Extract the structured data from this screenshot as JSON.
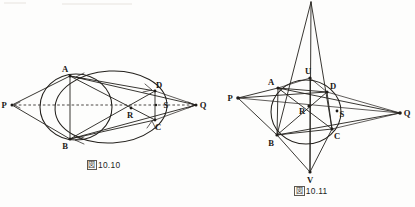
{
  "page": {
    "width": 415,
    "height": 207,
    "background": "#fdfdfc",
    "ink_color": "#23201c"
  },
  "figures": [
    {
      "id": "figure-10-10",
      "caption_marker": "図",
      "caption_number": "10.10",
      "caption_full": "図10.10",
      "description": "Ellipse and circle through points A, B with inscribed quadrilateral ABCD, diagonal intersection R, point S, and external points P and Q joined by a dashed line P-R-S-Q.",
      "points": [
        {
          "label": "A",
          "x": 70,
          "y": 76,
          "label_dx": -5,
          "label_dy": -4
        },
        {
          "label": "B",
          "x": 70,
          "y": 139,
          "label_dx": -5,
          "label_dy": 10
        },
        {
          "label": "C",
          "x": 155,
          "y": 120,
          "label_dx": 2,
          "label_dy": 10
        },
        {
          "label": "D",
          "x": 155,
          "y": 91,
          "label_dx": 3,
          "label_dy": -3
        },
        {
          "label": "R",
          "x": 131,
          "y": 108,
          "label_dx": -2,
          "label_dy": 10
        },
        {
          "label": "S",
          "x": 160,
          "y": 105,
          "label_dx": 4,
          "label_dy": 2
        },
        {
          "label": "P",
          "x": 12,
          "y": 105,
          "label_dx": -9,
          "label_dy": 3
        },
        {
          "label": "Q",
          "x": 196,
          "y": 105,
          "label_dx": 4,
          "label_dy": 3
        }
      ],
      "segments": [
        "P-A",
        "P-B",
        "A-B",
        "A-C",
        "A-D",
        "B-C",
        "B-D",
        "C-D",
        "A-Q",
        "B-Q",
        "D-Q",
        "C-Q"
      ],
      "dashed_segments": [
        "P-Q through R and S"
      ],
      "curves": [
        "ellipse through A B C D",
        "circle through A B"
      ]
    },
    {
      "id": "figure-10-11",
      "caption_marker": "図",
      "caption_number": "10.11",
      "caption_full": "図10.11",
      "description": "Circle through A, B, C, D with apex above, interior point U, lower point V, diagonal intersection R, point S, and external points P and Q.",
      "points": [
        {
          "label": "A",
          "x": 278,
          "y": 88,
          "label_dx": -8,
          "label_dy": -2
        },
        {
          "label": "B",
          "x": 277,
          "y": 135,
          "label_dx": -6,
          "label_dy": 11
        },
        {
          "label": "C",
          "x": 332,
          "y": 129,
          "label_dx": 4,
          "label_dy": 9
        },
        {
          "label": "D",
          "x": 327,
          "y": 92,
          "label_dx": 4,
          "label_dy": -2
        },
        {
          "label": "R",
          "x": 309,
          "y": 106,
          "label_dx": -8,
          "label_dy": 7
        },
        {
          "label": "S",
          "x": 337,
          "y": 111,
          "label_dx": 3,
          "label_dy": 5
        },
        {
          "label": "U",
          "x": 310,
          "y": 78,
          "label_dx": -2,
          "label_dy": -4
        },
        {
          "label": "V",
          "x": 310,
          "y": 172,
          "label_dx": -2,
          "label_dy": 11
        },
        {
          "label": "P",
          "x": 238,
          "y": 98,
          "label_dx": -9,
          "label_dy": 2
        },
        {
          "label": "Q",
          "x": 400,
          "y": 113,
          "label_dx": 4,
          "label_dy": 3
        }
      ],
      "apex": {
        "x": 311,
        "y": 2
      },
      "segments": [
        "apex-A",
        "apex-B",
        "apex-D",
        "apex-C",
        "apex-U",
        "U-V",
        "P-A",
        "P-B",
        "P-D",
        "P-S",
        "P-Q",
        "A-B",
        "A-C",
        "A-D",
        "B-C",
        "B-D",
        "C-D",
        "A-Q",
        "B-Q",
        "C-Q",
        "D-Q",
        "V-A",
        "V-B",
        "V-C",
        "V-D",
        "U-A",
        "U-B",
        "U-C",
        "U-D"
      ],
      "curves": [
        "circle through A B C D"
      ]
    }
  ]
}
